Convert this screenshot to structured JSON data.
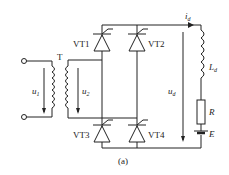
{
  "diagram": {
    "caption": "(a)",
    "transformer": {
      "label": "T",
      "primary_voltage": "u",
      "primary_sub": "1",
      "secondary_voltage": "u",
      "secondary_sub": "2"
    },
    "thyristors": [
      {
        "label": "VT1"
      },
      {
        "label": "VT2"
      },
      {
        "label": "VT3"
      },
      {
        "label": "VT4"
      }
    ],
    "load": {
      "current": "i",
      "current_sub": "d",
      "voltage": "u",
      "voltage_sub": "d",
      "inductor": "L",
      "inductor_sub": "d",
      "resistor": "R",
      "emf": "E"
    }
  }
}
